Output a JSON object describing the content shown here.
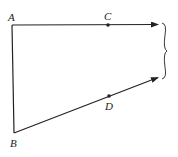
{
  "diagram": {
    "labels": {
      "A": "A",
      "B": "B",
      "C": "C",
      "D": "D"
    },
    "points": {
      "A": [
        12,
        25
      ],
      "B": [
        14,
        133
      ],
      "C": [
        108,
        25
      ],
      "D": [
        109,
        96
      ],
      "upper_arrow_end": [
        159,
        24
      ],
      "lower_arrow_end": [
        159,
        77
      ]
    },
    "edges": [
      {
        "from": "A",
        "to": "B",
        "type": "segment"
      },
      {
        "from": "A",
        "to": "upper_arrow_end",
        "through": "C",
        "type": "ray"
      },
      {
        "from": "B",
        "to": "lower_arrow_end",
        "through": "D",
        "type": "ray"
      }
    ],
    "brace": {
      "side": "right",
      "y_top": 23,
      "y_bottom": 79
    },
    "stroke_color": "#222222"
  }
}
